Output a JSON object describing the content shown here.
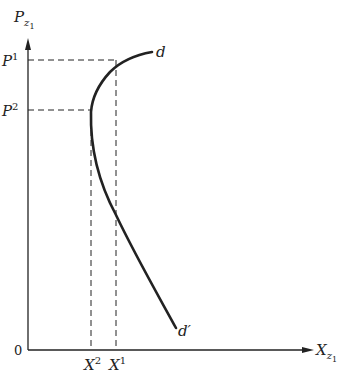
{
  "diagram": {
    "type": "demand-curve",
    "y_axis": {
      "label": "P",
      "subscript": "z",
      "sub_subscript": "1"
    },
    "x_axis": {
      "label": "X",
      "subscript": "z",
      "sub_subscript": "1"
    },
    "origin_label": "0",
    "y_ticks": [
      {
        "label": "P",
        "sup": "1"
      },
      {
        "label": "P",
        "sup": "2"
      }
    ],
    "x_ticks": [
      {
        "label": "X",
        "sup": "2"
      },
      {
        "label": "X",
        "sup": "1"
      }
    ],
    "curve": {
      "start_label": "d",
      "end_label": "d′"
    },
    "colors": {
      "ink": "#222222",
      "background": "#ffffff"
    }
  }
}
